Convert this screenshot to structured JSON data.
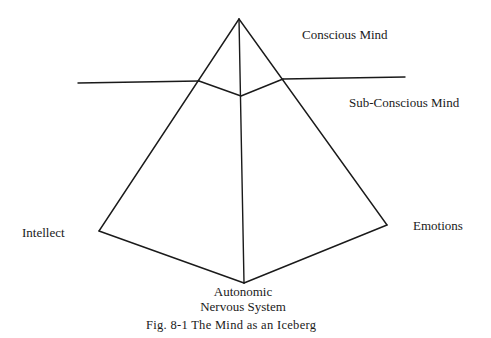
{
  "figure": {
    "caption": "Fig. 8-1 The Mind as an Iceberg",
    "labels": {
      "conscious": "Conscious Mind",
      "subconscious": "Sub-Conscious Mind",
      "intellect": "Intellect",
      "emotions": "Emotions",
      "autonomic_line1": "Autonomic",
      "autonomic_line2": "Nervous System"
    },
    "line_color": "#1a1a1a",
    "geometry": {
      "apex": [
        239,
        19
      ],
      "waterline_left": [
        [
          78,
          83
        ],
        [
          199,
          81
        ]
      ],
      "waterline_right": [
        [
          283,
          79
        ],
        [
          405,
          77
        ]
      ],
      "inner_v": [
        [
          199,
          81
        ],
        [
          241,
          96
        ],
        [
          283,
          79
        ]
      ],
      "left_vertex": [
        99,
        231
      ],
      "right_vertex": [
        387,
        225
      ],
      "bottom_vertex": [
        244,
        283
      ]
    }
  }
}
